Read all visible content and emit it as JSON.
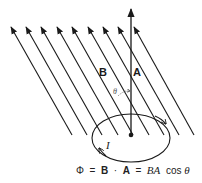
{
  "diagram": {
    "type": "magnetic-flux-through-loop",
    "labels": {
      "field": "B",
      "area_vector": "A",
      "angle": "θ",
      "current": "I"
    },
    "equation": {
      "phi": "Φ",
      "eq1": "=",
      "B": "B",
      "dot": "·",
      "A": "A",
      "eq2": "=",
      "BA": "BA",
      "cos": "cos",
      "theta": "θ"
    },
    "field_lines_count": 9,
    "colors": {
      "ink": "#1a1a1a",
      "background": "#ffffff"
    }
  }
}
